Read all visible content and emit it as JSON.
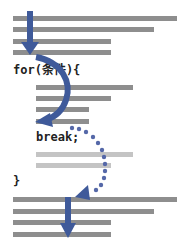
{
  "code": {
    "loop_header": "for(条件){",
    "break_stmt": "break;",
    "closing_brace": "}"
  },
  "colors": {
    "bar": "#8e8e8e",
    "bar_light": "#c4c4c4",
    "arrow": "#3f5a9a",
    "dots": "#5568a8"
  },
  "icons": {
    "flow_in_arrow": "arrow-down-icon",
    "loop_arrow": "curved-arrow-icon",
    "break_jump_arrow": "dotted-curved-arrow-icon",
    "flow_out_arrow": "arrow-down-icon"
  }
}
